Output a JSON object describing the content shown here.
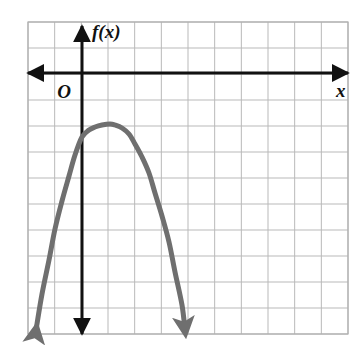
{
  "figure": {
    "background_color": "#ffffff",
    "width": 360,
    "height": 350
  },
  "grid": {
    "line_color": "#b9b9b9",
    "border_color": "#b0b0b0",
    "columns": 12,
    "rows": 12,
    "cell_size_px": 26.7,
    "left_px": 28,
    "top_px": 22,
    "right_px": 348,
    "bottom_px": 334
  },
  "axes": {
    "color": "#111111",
    "x_axis": {
      "label": "x",
      "label_x_px": 336,
      "label_y_px": 93,
      "y_px": 73,
      "start_px": 28,
      "end_px": 348,
      "arrow_both_ends": true
    },
    "y_axis": {
      "label": "f(x)",
      "label_x_px": 92,
      "label_y_px": 34,
      "x_px": 82,
      "start_px": 26,
      "end_px": 334,
      "arrow_both_ends": true
    },
    "origin": {
      "label": "O",
      "label_x_px": 64,
      "label_y_px": 94,
      "x_px": 82,
      "y_px": 73
    }
  },
  "chart_data": {
    "type": "line",
    "title": "",
    "xlabel": "x",
    "ylabel": "f(x)",
    "curve_name": "f(x)",
    "curve_color": "#6f6f6f",
    "curve_width_px": 5,
    "shape": "downward-opening parabola",
    "grid": true,
    "legend": "none",
    "axis_unit_px": 26.7,
    "xlim": [
      -2,
      10
    ],
    "ylim": [
      -9.8,
      2
    ],
    "vertex": {
      "x": 1.05,
      "y": -1.91
    },
    "y_intercept": {
      "x": 0,
      "y": -3.07
    },
    "real_roots": [],
    "arrowheads": [
      "left-end",
      "right-end"
    ],
    "x": [
      -1.73,
      -1.5,
      -1.25,
      -1.0,
      -0.75,
      -0.5,
      -0.25,
      0.0,
      0.25,
      0.5,
      0.75,
      1.05,
      1.25,
      1.5,
      1.75,
      2.0,
      2.25,
      2.5,
      2.75,
      3.0,
      3.25,
      3.5,
      3.75,
      3.86
    ],
    "y": [
      -9.64,
      -8.3,
      -7.0,
      -5.83,
      -4.78,
      -3.86,
      -3.06,
      -2.39,
      -2.12,
      -2.0,
      -1.93,
      -1.91,
      -1.93,
      -2.05,
      -2.29,
      -2.66,
      -3.15,
      -3.76,
      -4.5,
      -5.36,
      -6.34,
      -7.45,
      -8.68,
      -9.26
    ],
    "points_px": [
      {
        "x": 36,
        "y": 330
      },
      {
        "x": 42,
        "y": 294
      },
      {
        "x": 49,
        "y": 260
      },
      {
        "x": 55,
        "y": 229
      },
      {
        "x": 62,
        "y": 201
      },
      {
        "x": 69,
        "y": 176
      },
      {
        "x": 75,
        "y": 155
      },
      {
        "x": 82,
        "y": 137
      },
      {
        "x": 89,
        "y": 130
      },
      {
        "x": 95,
        "y": 127
      },
      {
        "x": 102,
        "y": 125
      },
      {
        "x": 110,
        "y": 124
      },
      {
        "x": 115,
        "y": 125
      },
      {
        "x": 122,
        "y": 128
      },
      {
        "x": 129,
        "y": 134
      },
      {
        "x": 135,
        "y": 144
      },
      {
        "x": 142,
        "y": 157
      },
      {
        "x": 149,
        "y": 173
      },
      {
        "x": 155,
        "y": 193
      },
      {
        "x": 162,
        "y": 216
      },
      {
        "x": 169,
        "y": 242
      },
      {
        "x": 175,
        "y": 272
      },
      {
        "x": 182,
        "y": 305
      },
      {
        "x": 185,
        "y": 330
      }
    ]
  }
}
